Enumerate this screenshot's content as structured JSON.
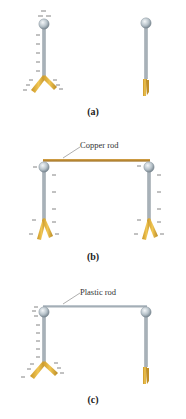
{
  "figure": {
    "panels": [
      {
        "id": "a",
        "label": "(a)",
        "connector": null,
        "left_electroscope": {
          "state": "charged",
          "leaves": "spread",
          "charge_sign": "-"
        },
        "right_electroscope": {
          "state": "neutral",
          "leaves": "closed",
          "charge_sign": ""
        }
      },
      {
        "id": "b",
        "label": "(b)",
        "connector": {
          "label": "Copper rod",
          "material": "conductor",
          "color": "#b8862c"
        },
        "left_electroscope": {
          "state": "charged",
          "leaves": "spread",
          "charge_sign": "-"
        },
        "right_electroscope": {
          "state": "charged",
          "leaves": "spread",
          "charge_sign": "-"
        }
      },
      {
        "id": "c",
        "label": "(c)",
        "connector": {
          "label": "Plastic rod",
          "material": "insulator",
          "color": "#a9b4bd"
        },
        "left_electroscope": {
          "state": "charged",
          "leaves": "spread",
          "charge_sign": "-"
        },
        "right_electroscope": {
          "state": "neutral",
          "leaves": "closed",
          "charge_sign": ""
        }
      }
    ],
    "colors": {
      "leaf_gold": "#e0b23a",
      "leaf_gold_dark": "#b8892a",
      "stem_gray": "#8e9aa3",
      "ball_light": "#e8eef2",
      "ball_dark": "#7d8b95",
      "charge_mark": "#555555",
      "copper": "#b8862c",
      "plastic": "#a9b4bd"
    }
  }
}
